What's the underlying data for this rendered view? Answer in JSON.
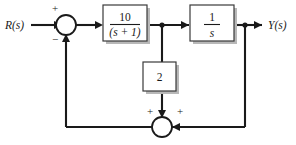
{
  "diagram": {
    "type": "control-system-block-diagram",
    "background_color": "#ffffff",
    "line_color": "#1a1a1a",
    "box_fill": "#ffffff",
    "box_stroke": "#3a3a3a",
    "shadow_color": "#b8b8b8",
    "input": {
      "label": "R(s)"
    },
    "output": {
      "label": "Y(s)"
    },
    "blocks": [
      {
        "id": "plant-1",
        "numerator": "10",
        "denominator": "(s + 1)",
        "orientation": "horizontal"
      },
      {
        "id": "integrator",
        "numerator": "1",
        "denominator": "s",
        "orientation": "horizontal"
      },
      {
        "id": "gain",
        "value": "2",
        "orientation": "vertical"
      }
    ],
    "summers": [
      {
        "id": "input-summer",
        "sign_top_left": "+",
        "sign_bottom_left": "−"
      },
      {
        "id": "inner-summer",
        "sign_top_left": "+",
        "sign_top_right": "+"
      }
    ]
  }
}
